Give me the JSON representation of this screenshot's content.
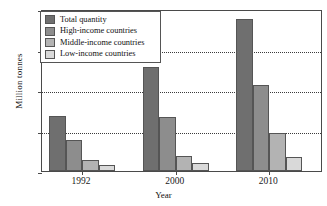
{
  "chart_data": {
    "type": "bar",
    "title": "",
    "xlabel": "Year",
    "ylabel": "Million tonnes",
    "categories": [
      "1992",
      "2000",
      "2010"
    ],
    "series": [
      {
        "name": "Total quantity",
        "values": [
          0.68,
          1.28,
          1.88
        ],
        "color": "#6f6f6f"
      },
      {
        "name": "High-income countries",
        "values": [
          0.38,
          0.67,
          1.06
        ],
        "color": "#8d8d8d"
      },
      {
        "name": "Middle-income countries",
        "values": [
          0.13,
          0.18,
          0.47
        ],
        "color": "#b3b3b3"
      },
      {
        "name": "Low-income countries",
        "values": [
          0.08,
          0.1,
          0.17
        ],
        "color": "#d9d9d9"
      }
    ],
    "ylim": [
      0.0,
      2.0
    ],
    "yticks": [
      "0.0",
      "0.5",
      "1.0",
      "1.5",
      "2.0"
    ],
    "ytick_values": [
      0.0,
      0.5,
      1.0,
      1.5,
      2.0
    ],
    "grid": "horizontal-dotted",
    "legend_position": "top-left"
  },
  "legend": {
    "items": [
      {
        "label": "Total quantity"
      },
      {
        "label": "High-income countries"
      },
      {
        "label": "Middle-income countries"
      },
      {
        "label": "Low-income countries"
      }
    ]
  },
  "axes": {
    "y_title": "Million tonnes",
    "x_title": "Year",
    "y_labels": [
      "2.0",
      "1.5",
      "1.0",
      "0.5",
      "0.0"
    ],
    "x_labels": [
      "1992",
      "2000",
      "2010"
    ]
  }
}
